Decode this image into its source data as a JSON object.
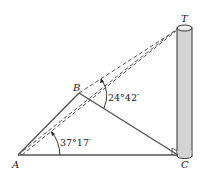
{
  "diagram": {
    "type": "geometry-figure",
    "points": {
      "A": {
        "label": "A",
        "x": 18,
        "y": 155
      },
      "B": {
        "label": "B",
        "x": 79,
        "y": 93
      },
      "C": {
        "label": "C",
        "x": 178,
        "y": 155
      },
      "T": {
        "label": "T",
        "x": 184,
        "y": 6
      }
    },
    "angles": {
      "at_A": {
        "label": "37°17′",
        "vertex": "A"
      },
      "at_B": {
        "label": "24°42′",
        "vertex": "B"
      }
    },
    "segments": [
      {
        "from": "A",
        "to": "B",
        "style": "solid"
      },
      {
        "from": "B",
        "to": "C",
        "style": "solid"
      },
      {
        "from": "A",
        "to": "C",
        "style": "solid"
      },
      {
        "from": "A",
        "to": "T",
        "style": "dashed"
      },
      {
        "from": "B",
        "to": "T",
        "style": "dashed"
      }
    ],
    "tower": {
      "description": "cylindrical tower with top T and base C"
    },
    "right_angle_at": "C",
    "colors": {
      "line": "#444444",
      "tower_fill": "#d4d4d4",
      "tower_stroke": "#333333"
    }
  }
}
